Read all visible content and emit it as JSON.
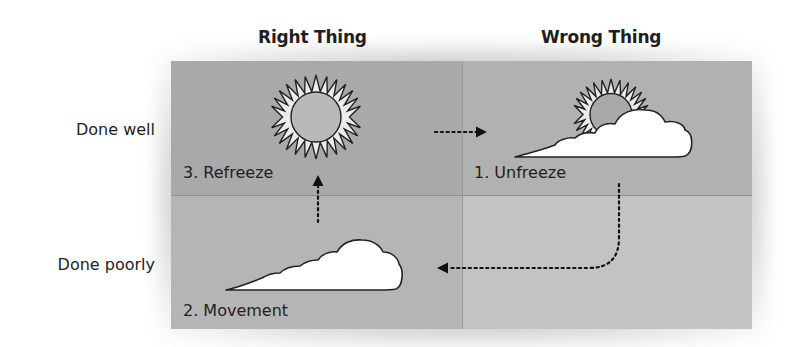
{
  "columns": [
    {
      "label": "Right Thing"
    },
    {
      "label": "Wrong Thing"
    }
  ],
  "rows": [
    {
      "label": "Done well"
    },
    {
      "label": "Done poorly"
    }
  ],
  "cells": {
    "right_well": {
      "label": "3. Refreeze",
      "icon": "sun-icon",
      "color": "#a9a9a9"
    },
    "wrong_well": {
      "label": "1. Unfreeze",
      "icon": "sun-behind-cloud-icon",
      "color": "#b1b1b1"
    },
    "right_poorly": {
      "label": "2. Movement",
      "icon": "cloud-icon",
      "color": "#b5b5b5"
    },
    "wrong_poorly": {
      "label": "",
      "icon": "",
      "color": "#c3c3c3"
    }
  },
  "arrows": [
    {
      "from": "right_well",
      "to": "wrong_well",
      "style": "dotted",
      "direction": "right"
    },
    {
      "from": "wrong_well",
      "to": "right_poorly",
      "style": "dotted",
      "direction": "down-then-left"
    },
    {
      "from": "right_poorly",
      "to": "right_well",
      "style": "dotted",
      "direction": "up"
    }
  ]
}
